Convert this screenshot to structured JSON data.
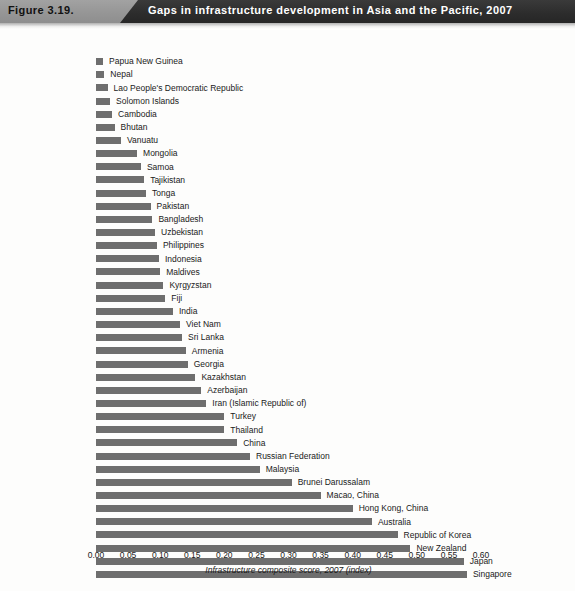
{
  "header": {
    "figure_number": "Figure 3.19.",
    "title": "Gaps in infrastructure development in Asia and the Pacific, 2007",
    "band_color": "#9b9b9b",
    "dark_color": "#2f2f2f",
    "title_color": "#ffffff"
  },
  "chart_data": {
    "type": "bar",
    "orientation": "horizontal",
    "title": "Gaps in infrastructure development in Asia and the Pacific, 2007",
    "xlabel": "Infrastructure composite score, 2007 (index)",
    "ylabel": "",
    "xlim": [
      0.0,
      0.6
    ],
    "xticks": [
      "0.00",
      "0.05",
      "0.10",
      "0.15",
      "0.20",
      "0.25",
      "0.30",
      "0.35",
      "0.40",
      "0.45",
      "0.50",
      "0.55",
      "0.60"
    ],
    "xtick_values": [
      0.0,
      0.05,
      0.1,
      0.15,
      0.2,
      0.25,
      0.3,
      0.35,
      0.4,
      0.45,
      0.5,
      0.55,
      0.6
    ],
    "grid": false,
    "legend": "none",
    "bar_color": "#6e6e6e",
    "categories": [
      "Papua New Guinea",
      "Nepal",
      "Lao People's Democratic Republic",
      "Solomon Islands",
      "Cambodia",
      "Bhutan",
      "Vanuatu",
      "Mongolia",
      "Samoa",
      "Tajikistan",
      "Tonga",
      "Pakistan",
      "Bangladesh",
      "Uzbekistan",
      "Philippines",
      "Indonesia",
      "Maldives",
      "Kyrgyzstan",
      "Fiji",
      "India",
      "Viet Nam",
      "Sri Lanka",
      "Armenia",
      "Georgia",
      "Kazakhstan",
      "Azerbaijan",
      "Iran (Islamic Republic of)",
      "Turkey",
      "Thailand",
      "China",
      "Russian Federation",
      "Malaysia",
      "Brunei Darussalam",
      "Macao, China",
      "Hong Kong, China",
      "Australia",
      "Republic of Korea",
      "New Zealand",
      "Japan",
      "Singapore"
    ],
    "values": [
      0.011,
      0.013,
      0.018,
      0.022,
      0.025,
      0.029,
      0.039,
      0.064,
      0.07,
      0.075,
      0.078,
      0.085,
      0.088,
      0.092,
      0.095,
      0.098,
      0.1,
      0.105,
      0.108,
      0.12,
      0.131,
      0.134,
      0.14,
      0.143,
      0.155,
      0.164,
      0.172,
      0.2,
      0.2,
      0.22,
      0.24,
      0.255,
      0.305,
      0.35,
      0.4,
      0.43,
      0.47,
      0.49,
      0.573,
      0.578
    ]
  }
}
